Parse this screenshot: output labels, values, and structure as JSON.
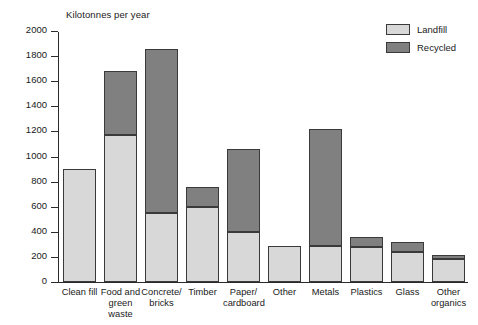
{
  "chart_data": {
    "type": "bar",
    "title": "",
    "subtitle": "",
    "ylabel": "Kilotonnes per year",
    "xlabel": "",
    "ylim": [
      0,
      2000
    ],
    "ytick_step": 200,
    "yticks": [
      0,
      200,
      400,
      600,
      800,
      1000,
      1200,
      1400,
      1600,
      1800,
      2000
    ],
    "ytick_labels": [
      "0",
      "200",
      "400",
      "600",
      "800",
      "1000",
      "1200",
      "1400",
      "1600",
      "1800",
      "2000"
    ],
    "grid": false,
    "stacked": true,
    "legend_position": "top-right",
    "categories": [
      "Clean fill",
      "Food and\ngreen waste",
      "Concrete/\nbricks",
      "Timber",
      "Paper/\ncardboard",
      "Other",
      "Metals",
      "Plastics",
      "Glass",
      "Other\norganics"
    ],
    "series": [
      {
        "name": "Landfill",
        "color": "#d8d8d8",
        "values": [
          900,
          1170,
          550,
          600,
          400,
          290,
          290,
          280,
          240,
          180
        ]
      },
      {
        "name": "Recycled",
        "color": "#808080",
        "values": [
          0,
          500,
          1300,
          150,
          650,
          0,
          920,
          70,
          70,
          30
        ]
      }
    ],
    "totals": [
      900,
      1670,
      1850,
      750,
      1050,
      290,
      1210,
      350,
      310,
      210
    ]
  },
  "legend": {
    "items": [
      {
        "label": "Landfill",
        "color": "#d8d8d8"
      },
      {
        "label": "Recycled",
        "color": "#808080"
      }
    ]
  }
}
